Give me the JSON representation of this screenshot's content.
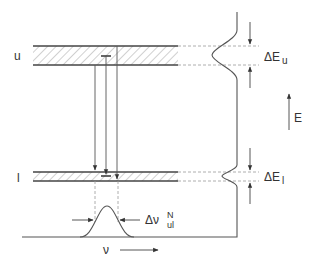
{
  "diagram": {
    "type": "energy-level-diagram",
    "levels": [
      {
        "id": "upper",
        "label": "u",
        "width_label_prefix": "ΔE",
        "width_label_sub": "u"
      },
      {
        "id": "lower",
        "label": "l",
        "width_label_prefix": "ΔE",
        "width_label_sub": "l"
      }
    ],
    "energy_axis_label": "E",
    "frequency_axis_label": "ν",
    "linewidth_label": {
      "prefix": "Δν",
      "sup": "N",
      "sub": "ul"
    },
    "colors": {
      "line": "#555555",
      "hatch": "#888888",
      "text": "#333333",
      "dashed": "#999999"
    }
  }
}
